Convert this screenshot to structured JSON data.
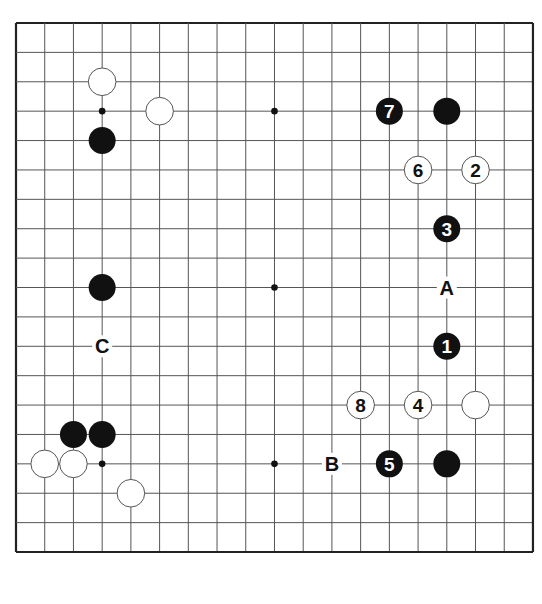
{
  "board": {
    "size": 19,
    "origin_x": 16,
    "origin_y": 23,
    "spacing_x": 28.72,
    "spacing_y": 29.39,
    "line_color": "#555555",
    "border_color": "#222222",
    "black_color": "#111111",
    "white_fill": "#ffffff",
    "white_stroke": "#555555",
    "star_points": [
      [
        3,
        3
      ],
      [
        9,
        3
      ],
      [
        15,
        3
      ],
      [
        3,
        9
      ],
      [
        9,
        9
      ],
      [
        15,
        9
      ],
      [
        3,
        15
      ],
      [
        9,
        15
      ],
      [
        15,
        15
      ]
    ]
  },
  "stones": [
    {
      "color": "white",
      "col": 3,
      "row": 2,
      "label": ""
    },
    {
      "color": "white",
      "col": 5,
      "row": 3,
      "label": ""
    },
    {
      "color": "black",
      "col": 3,
      "row": 4,
      "label": ""
    },
    {
      "color": "black",
      "col": 13,
      "row": 3,
      "label": "7"
    },
    {
      "color": "black",
      "col": 15,
      "row": 3,
      "label": ""
    },
    {
      "color": "white",
      "col": 14,
      "row": 5,
      "label": "6"
    },
    {
      "color": "white",
      "col": 16,
      "row": 5,
      "label": "2"
    },
    {
      "color": "black",
      "col": 15,
      "row": 7,
      "label": "3"
    },
    {
      "color": "black",
      "col": 3,
      "row": 9,
      "label": ""
    },
    {
      "color": "black",
      "col": 15,
      "row": 11,
      "label": "1"
    },
    {
      "color": "white",
      "col": 12,
      "row": 13,
      "label": "8"
    },
    {
      "color": "white",
      "col": 14,
      "row": 13,
      "label": "4"
    },
    {
      "color": "white",
      "col": 16,
      "row": 13,
      "label": ""
    },
    {
      "color": "black",
      "col": 2,
      "row": 14,
      "label": ""
    },
    {
      "color": "black",
      "col": 3,
      "row": 14,
      "label": ""
    },
    {
      "color": "white",
      "col": 1,
      "row": 15,
      "label": ""
    },
    {
      "color": "white",
      "col": 2,
      "row": 15,
      "label": ""
    },
    {
      "color": "black",
      "col": 13,
      "row": 15,
      "label": "5"
    },
    {
      "color": "black",
      "col": 15,
      "row": 15,
      "label": ""
    },
    {
      "color": "white",
      "col": 4,
      "row": 16,
      "label": ""
    }
  ],
  "markers": [
    {
      "label": "A",
      "col": 15,
      "row": 9
    },
    {
      "label": "B",
      "col": 11,
      "row": 15
    },
    {
      "label": "C",
      "col": 3,
      "row": 11
    }
  ]
}
